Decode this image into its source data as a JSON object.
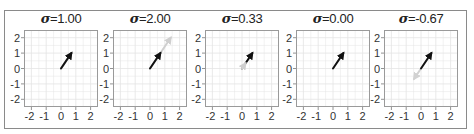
{
  "figure": {
    "border_color": "#8a8a8a",
    "grid_color": "#e4e4e4",
    "frame_color": "#9a9a9a",
    "primary_arrow_color": "#111111",
    "secondary_arrow_color": "#c8c8c8"
  },
  "chart_data": [
    {
      "type": "quiver",
      "title": "σ=1.00",
      "sigma_symbol": "σ",
      "sigma_value": "=1.00",
      "sigma": 1.0,
      "xlim": [
        -2.5,
        2.5
      ],
      "ylim": [
        -2.5,
        2.5
      ],
      "xticks": [
        -2,
        -1,
        0,
        1,
        2
      ],
      "yticks": [
        2,
        1,
        0,
        -1,
        -2
      ],
      "grid": true,
      "vectors": [
        {
          "name": "scaled",
          "origin": [
            0,
            0
          ],
          "tip": [
            0.7,
            1.0
          ],
          "color": "#b5b5b5"
        },
        {
          "name": "original",
          "origin": [
            0,
            0
          ],
          "tip": [
            0.7,
            1.0
          ],
          "color": "#111111"
        }
      ]
    },
    {
      "type": "quiver",
      "title": "σ=2.00",
      "sigma_symbol": "σ",
      "sigma_value": "=2.00",
      "sigma": 2.0,
      "xlim": [
        -2.5,
        2.5
      ],
      "ylim": [
        -2.5,
        2.5
      ],
      "xticks": [
        -2,
        -1,
        0,
        1,
        2
      ],
      "yticks": [
        2,
        1,
        0,
        -1,
        -2
      ],
      "grid": true,
      "vectors": [
        {
          "name": "scaled",
          "origin": [
            0,
            0
          ],
          "tip": [
            1.4,
            2.0
          ],
          "color": "#cfcfcf"
        },
        {
          "name": "original",
          "origin": [
            0,
            0
          ],
          "tip": [
            0.7,
            1.0
          ],
          "color": "#111111"
        }
      ]
    },
    {
      "type": "quiver",
      "title": "σ=0.33",
      "sigma_symbol": "σ",
      "sigma_value": "=0.33",
      "sigma": 0.33,
      "xlim": [
        -2.5,
        2.5
      ],
      "ylim": [
        -2.5,
        2.5
      ],
      "xticks": [
        -2,
        -1,
        0,
        1,
        2
      ],
      "yticks": [
        2,
        1,
        0,
        -1,
        -2
      ],
      "grid": true,
      "vectors": [
        {
          "name": "original",
          "origin": [
            0,
            0
          ],
          "tip": [
            0.7,
            1.0
          ],
          "color": "#111111"
        },
        {
          "name": "scaled",
          "origin": [
            0,
            0
          ],
          "tip": [
            0.23,
            0.33
          ],
          "color": "#cfcfcf"
        }
      ]
    },
    {
      "type": "quiver",
      "title": "σ=0.00",
      "sigma_symbol": "σ",
      "sigma_value": "=0.00",
      "sigma": 0.0,
      "xlim": [
        -2.5,
        2.5
      ],
      "ylim": [
        -2.5,
        2.5
      ],
      "xticks": [
        -2,
        -1,
        0,
        1,
        2
      ],
      "yticks": [
        2,
        1,
        0,
        -1,
        -2
      ],
      "grid": true,
      "vectors": [
        {
          "name": "original",
          "origin": [
            0,
            0
          ],
          "tip": [
            0.7,
            1.0
          ],
          "color": "#111111"
        },
        {
          "name": "scaled",
          "origin": [
            0,
            0
          ],
          "tip": [
            0.0,
            0.0
          ],
          "color": "#cfcfcf"
        }
      ]
    },
    {
      "type": "quiver",
      "title": "σ=-0.67",
      "sigma_symbol": "σ",
      "sigma_value": "=-0.67",
      "sigma": -0.67,
      "xlim": [
        -2.5,
        2.5
      ],
      "ylim": [
        -2.5,
        2.5
      ],
      "xticks": [
        -2,
        -1,
        0,
        1,
        2
      ],
      "yticks": [
        2,
        1,
        0,
        -1,
        -2
      ],
      "grid": true,
      "vectors": [
        {
          "name": "scaled",
          "origin": [
            0,
            0
          ],
          "tip": [
            -0.47,
            -0.67
          ],
          "color": "#d2d2d2"
        },
        {
          "name": "original",
          "origin": [
            0,
            0
          ],
          "tip": [
            0.7,
            1.0
          ],
          "color": "#111111"
        }
      ]
    }
  ]
}
